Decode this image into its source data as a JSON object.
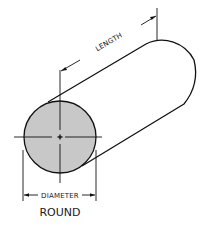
{
  "diagram": {
    "title": "ROUND",
    "shape": "round bar (cylinder)",
    "dimensions": {
      "length_label": "LENGTH",
      "diameter_label": "DIAMETER"
    },
    "colors": {
      "stroke": "#111111",
      "end_face_fill": "#c8c8c8",
      "background": "#ffffff"
    }
  }
}
